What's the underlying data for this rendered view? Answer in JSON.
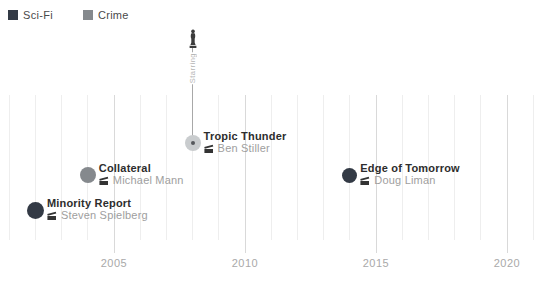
{
  "legend": {
    "items": [
      {
        "label": "Sci-Fi",
        "color": "#333a45"
      },
      {
        "label": "Crime",
        "color": "#85898d"
      }
    ]
  },
  "chart_data": {
    "type": "scatter",
    "title": "",
    "xlabel": "",
    "ylabel": "",
    "legend_position": "top-left",
    "grid": "vertical-yearly-gridlines",
    "x_axis": {
      "min": 2001,
      "max": 2021,
      "minor_tick_interval": 1,
      "labeled_ticks": [
        2005,
        2010,
        2015,
        2020
      ]
    },
    "points": [
      {
        "title": "Minority Report",
        "director": "Steven Spielberg",
        "year": 2002,
        "genre": "Sci-Fi",
        "color": "#333a45",
        "y_px": 210,
        "radius": 8.5
      },
      {
        "title": "Collateral",
        "director": "Michael Mann",
        "year": 2004,
        "genre": "Crime",
        "color": "#85898d",
        "y_px": 175,
        "radius": 8
      },
      {
        "title": "Tropic Thunder",
        "director": "Ben Stiller",
        "year": 2008,
        "color": "#c9ccce",
        "y_px": 143,
        "radius": 8,
        "center_dot_color": "#55585c",
        "annotated": true
      },
      {
        "title": "Edge of Tomorrow",
        "director": "Doug Liman",
        "year": 2014,
        "genre": "Sci-Fi",
        "color": "#333a45",
        "y_px": 175,
        "radius": 7.5
      }
    ],
    "annotation": {
      "target": "Tropic Thunder",
      "label": "Starring",
      "icon": "statuette-icon"
    }
  },
  "colors": {
    "minor_grid": "#eeeeee",
    "major_grid": "#d9d9d9",
    "tick_label": "#a9a9a9",
    "point_title": "#2d2d2d",
    "point_subtitle": "#9e9e9e",
    "pin_line": "#a8a8a8",
    "pin_text": "#b5b5b5",
    "icon": "#3c3c3c"
  }
}
